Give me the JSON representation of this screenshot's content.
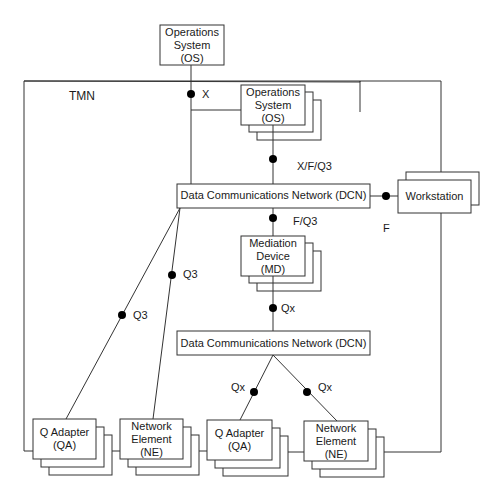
{
  "diagram": {
    "boundary_label": "TMN",
    "nodes": {
      "os_external": {
        "line1": "Operations",
        "line2": "System",
        "line3": "(OS)"
      },
      "os_internal": {
        "line1": "Operations",
        "line2": "System",
        "line3": "(OS)"
      },
      "dcn_upper": {
        "label": "Data Communications Network (DCN)"
      },
      "workstation": {
        "label": "Workstation"
      },
      "md": {
        "line1": "Mediation",
        "line2": "Device",
        "line3": "(MD)"
      },
      "dcn_lower": {
        "label": "Data Communications Network (DCN)"
      },
      "qa_left": {
        "line1": "Q Adapter",
        "line2": "(QA)"
      },
      "ne_left": {
        "line1": "Network",
        "line2": "Element",
        "line3": "(NE)"
      },
      "qa_right": {
        "line1": "Q Adapter",
        "line2": "(QA)"
      },
      "ne_right": {
        "line1": "Network",
        "line2": "Element",
        "line3": "(NE)"
      }
    },
    "interfaces": {
      "x": "X",
      "xfq3": "X/F/Q3",
      "f_workstation": "F",
      "fq3": "F/Q3",
      "qx_md": "Qx",
      "q3_qa": "Q3",
      "q3_ne": "Q3",
      "qx_qa": "Qx",
      "qx_ne": "Qx"
    }
  }
}
